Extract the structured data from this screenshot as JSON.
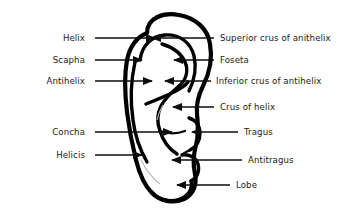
{
  "diagram": {
    "style": {
      "line_color": "#0d0d0d",
      "text_color": "#1a1a1a",
      "background_color": "#ffffff"
    },
    "labels_left": [
      {
        "id": "helix",
        "text": "Helix",
        "text_x": 85,
        "text_y": 41,
        "line_x1": 95,
        "line_x2": 155,
        "line_y": 38,
        "arrow": "right"
      },
      {
        "id": "scapha",
        "text": "Scapha",
        "text_x": 85,
        "text_y": 63,
        "line_x1": 95,
        "line_x2": 142,
        "line_y": 60,
        "arrow": "right"
      },
      {
        "id": "antihelix",
        "text": "Antihelix",
        "text_x": 85,
        "text_y": 84,
        "line_x1": 95,
        "line_x2": 152,
        "line_y": 81,
        "arrow": "right"
      },
      {
        "id": "concha",
        "text": "Concha",
        "text_x": 85,
        "text_y": 135,
        "line_x1": 95,
        "line_x2": 172,
        "line_y": 132,
        "arrow": "right"
      },
      {
        "id": "helicis",
        "text": "Helicis",
        "text_x": 85,
        "text_y": 158,
        "line_x1": 95,
        "line_x2": 142,
        "line_y": 155,
        "arrow": "right"
      }
    ],
    "labels_right": [
      {
        "id": "superior-crus-of-anithelix",
        "text": "Superior crus of anithelix",
        "text_x": 220,
        "text_y": 41,
        "line_x1": 152,
        "line_x2": 214,
        "line_y": 38,
        "arrow": "left"
      },
      {
        "id": "foseta",
        "text": "Foseta",
        "text_x": 220,
        "text_y": 63,
        "line_x1": 174,
        "line_x2": 214,
        "line_y": 60,
        "arrow": "left"
      },
      {
        "id": "inferior-crus-of-antihelix",
        "text": "Inferior crus of antihelix",
        "text_x": 216,
        "text_y": 84,
        "line_x1": 165,
        "line_x2": 211,
        "line_y": 81,
        "arrow": "left"
      },
      {
        "id": "crus-of-helix",
        "text": "Crus of helix",
        "text_x": 220,
        "text_y": 110,
        "line_x1": 173,
        "line_x2": 214,
        "line_y": 107,
        "arrow": "left"
      },
      {
        "id": "tragus",
        "text": "Tragus",
        "text_x": 244,
        "text_y": 135,
        "line_x1": 192,
        "line_x2": 238,
        "line_y": 132,
        "arrow": "left"
      },
      {
        "id": "antitragus",
        "text": "Antitragus",
        "text_x": 248,
        "text_y": 163,
        "line_x1": 172,
        "line_x2": 242,
        "line_y": 160,
        "arrow": "left"
      },
      {
        "id": "lobe",
        "text": "Lobe",
        "text_x": 236,
        "text_y": 188,
        "line_x1": 177,
        "line_x2": 230,
        "line_y": 185,
        "arrow": "left"
      }
    ],
    "ear_paths": {
      "outer_rim": "M 147 33 C 147 18, 163 12, 179 15 C 197 18, 208 30, 210 44 C 213 60, 209 74, 203 86 C 198 96, 196 104, 197 114 C 198 125, 199 135, 196 145 C 193 156, 193 165, 195 174 C 197 184, 194 194, 184 199 C 173 204, 160 201, 152 193 C 143 184, 139 172, 136 160 C 132 144, 129 128, 127 112 C 125 95, 124 76, 127 60 C 130 46, 137 37, 147 33 Z",
      "helix_inner": "M 140 60 C 142 45, 152 36, 165 35 C 180 34, 191 43, 194 56 C 197 69, 194 81, 189 91",
      "antihelix_upper": "M 162 44 C 172 47, 181 53, 185 62 C 189 71, 186 80, 179 86",
      "antihelix_lower": "M 179 86 C 172 92, 165 98, 161 106 C 157 114, 157 123, 160 131",
      "antihelix_stem": "M 160 131 C 163 141, 169 149, 177 154",
      "crus_helix": "M 146 104 C 156 100, 166 96, 174 92 C 180 89, 185 86, 188 82",
      "tragus": "M 189 118 C 196 120, 200 126, 200 133 C 200 141, 196 147, 190 150",
      "antitragus": "M 182 155 C 189 154, 196 157, 198 164 C 200 171, 197 178, 191 181",
      "intertragic": "M 190 150 C 186 152, 183 153, 182 155",
      "lobe": "M 191 181 C 193 189, 188 196, 180 199 C 170 203, 158 200, 152 192",
      "concha_edge": "M 160 131 C 168 134, 177 134, 185 131",
      "helicis_line": "M 135 62 C 131 80, 130 100, 133 120 C 135 136, 140 150, 147 162",
      "faint_line_1": "M 141 160 C 146 170, 152 178, 160 184",
      "faint_line_2": "M 163 105 C 160 110, 158 115, 157 120"
    }
  }
}
